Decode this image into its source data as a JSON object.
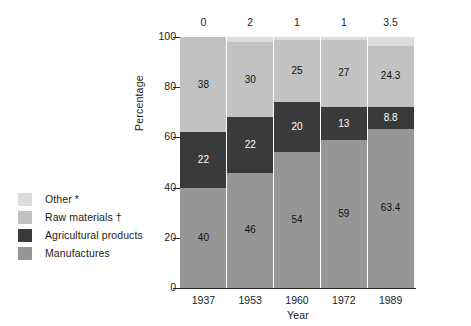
{
  "chart_data": {
    "type": "bar",
    "subtype": "stacked-bar-100-percent",
    "title": "",
    "xlabel": "Year",
    "ylabel": "Percentage",
    "categories": [
      "1937",
      "1953",
      "1960",
      "1972",
      "1989"
    ],
    "ylim": [
      0,
      100
    ],
    "yticks": [
      0,
      20,
      40,
      60,
      80,
      100
    ],
    "ytick_labels": [
      "0",
      "20",
      "40",
      "60",
      "80",
      "100"
    ],
    "grid": false,
    "legend_position": "left-outside",
    "stack_order_bottom_to_top": [
      "Manufactures",
      "Agricultural products",
      "Raw materials",
      "Other"
    ],
    "series": [
      {
        "name": "Manufactures",
        "color": "#969696",
        "text_color": "#111111",
        "values": [
          40,
          46,
          54,
          59,
          63.4
        ],
        "labels": [
          "40",
          "46",
          "54",
          "59",
          "63.4"
        ],
        "labels_shown": [
          true,
          true,
          true,
          true,
          true
        ]
      },
      {
        "name": "Agricultural products",
        "color": "#3a3a3a",
        "text_color": "#ffffff",
        "values": [
          22,
          22,
          20,
          13,
          8.8
        ],
        "labels": [
          "22",
          "22",
          "20",
          "13",
          "8.8"
        ],
        "labels_shown": [
          true,
          true,
          true,
          true,
          true
        ]
      },
      {
        "name": "Raw materials",
        "color": "#c2c2c2",
        "text_color": "#111111",
        "values": [
          38,
          30,
          25,
          27,
          24.3
        ],
        "labels": [
          "38",
          "30",
          "25",
          "27",
          "24.3"
        ],
        "labels_shown": [
          true,
          true,
          true,
          true,
          true
        ]
      },
      {
        "name": "Other",
        "color": "#dcdcdc",
        "text_color": "#1c1c1c",
        "values": [
          0,
          2,
          1,
          1,
          3.5
        ],
        "labels": [
          "0",
          "2",
          "1",
          "1",
          "3.5"
        ],
        "labels_shown": [
          false,
          false,
          false,
          false,
          false
        ],
        "labels_above_bar": [
          "0",
          "2",
          "1",
          "1",
          "3.5"
        ]
      }
    ]
  },
  "legend": {
    "items": [
      {
        "label": "Other *",
        "color": "#dcdcdc"
      },
      {
        "label": "Raw materials †",
        "color": "#c2c2c2"
      },
      {
        "label": "Agricultural products",
        "color": "#3a3a3a"
      },
      {
        "label": "Manufactures",
        "color": "#969696"
      }
    ]
  },
  "axes": {
    "y_title": "Percentage",
    "x_title": "Year",
    "y_tick_labels": [
      "100",
      "80",
      "60",
      "40",
      "20",
      "0"
    ],
    "x_tick_labels": [
      "1937",
      "1953",
      "1960",
      "1972",
      "1989"
    ]
  },
  "top_annotations": [
    "0",
    "2",
    "1",
    "1",
    "3.5"
  ]
}
